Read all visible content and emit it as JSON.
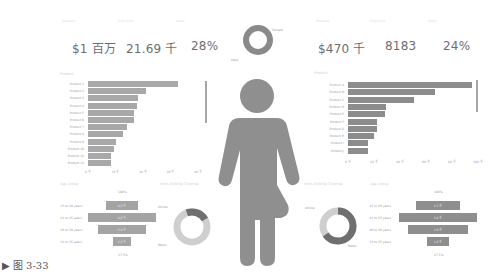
{
  "caption": "▶ 图 3-33",
  "left_panel": {
    "kpis": [
      {
        "label": "Revenue",
        "value": "$1 百万"
      },
      {
        "label": "Units Sold",
        "value": "21.69 千"
      },
      {
        "label": "Share",
        "value": "28%"
      }
    ],
    "bar_chart_title": "Product",
    "bar_chart": {
      "categories": [
        "Product 1",
        "Product 2",
        "Product 3",
        "Product 4",
        "Product 5",
        "Product 6",
        "Product 7",
        "Product 8",
        "Product 9",
        "Product 10",
        "Product 11",
        "Product 12"
      ],
      "values": [
        90,
        58,
        50,
        49,
        46,
        46,
        39,
        35,
        28,
        26,
        23,
        23
      ],
      "ticks": [
        "0 千",
        "10 千",
        "20 千",
        "30 千",
        "40 千"
      ]
    },
    "funnel_title": "Age Group",
    "funnel": {
      "top_label": "100%",
      "bottom_label": "17.5%",
      "rows": [
        {
          "label": "15 to 20 years",
          "value": "4.6 千"
        },
        {
          "label": "21 to 25 years",
          "value": "8.6 千"
        },
        {
          "label": "26 to 30 years",
          "value": "5.9 千"
        },
        {
          "label": "31 to 35 years",
          "value": "2.0 千"
        }
      ]
    },
    "donut_title": "Units Sold by Channel",
    "donut": {
      "labels": [
        "Online",
        "Retail"
      ],
      "values": [
        22,
        78
      ]
    }
  },
  "center": {
    "gender_donut": {
      "labels": [
        "Female",
        "Male"
      ],
      "values": [
        50,
        50
      ]
    },
    "figure": "gender-figure"
  },
  "right_panel": {
    "kpis": [
      {
        "label": "Revenue",
        "value": "$470 千"
      },
      {
        "label": "Units Sold",
        "value": "8183"
      },
      {
        "label": "Share",
        "value": "24%"
      }
    ],
    "bar_chart_title": "Product",
    "bar_chart": {
      "categories": [
        "Product A",
        "Product B",
        "Product C",
        "Product D",
        "Product E",
        "Product F",
        "Product G",
        "Product H",
        "Product I",
        "Product J"
      ],
      "values": [
        100,
        70,
        53,
        31,
        30,
        23,
        23,
        21,
        16,
        16
      ],
      "ticks": [
        "0 千",
        "20 千",
        "40 千",
        "60 千",
        "80 千",
        "100 千"
      ]
    },
    "donut_title": "Units Sold by Channel",
    "donut": {
      "labels": [
        "Online",
        "Retail"
      ],
      "values": [
        35,
        65
      ]
    },
    "funnel_title": "Age Group",
    "funnel": {
      "top_label": "100%",
      "bottom_label": "27.5%",
      "rows": [
        {
          "label": "15 to 20 years",
          "value": "2.1 千"
        },
        {
          "label": "21 to 25 years",
          "value": "3.8 千"
        },
        {
          "label": "26 to 30 years",
          "value": "2.9 千"
        },
        {
          "label": "31 to 35 years",
          "value": "1.0 千"
        }
      ]
    }
  },
  "chart_data": [
    {
      "type": "bar",
      "title": "Product (left)",
      "categories": [
        "Product 1",
        "Product 2",
        "Product 3",
        "Product 4",
        "Product 5",
        "Product 6",
        "Product 7",
        "Product 8",
        "Product 9",
        "Product 10",
        "Product 11",
        "Product 12"
      ],
      "values": [
        90,
        58,
        50,
        49,
        46,
        46,
        39,
        35,
        28,
        26,
        23,
        23
      ],
      "orientation": "horizontal"
    },
    {
      "type": "bar",
      "title": "Product (right)",
      "categories": [
        "Product A",
        "Product B",
        "Product C",
        "Product D",
        "Product E",
        "Product F",
        "Product G",
        "Product H",
        "Product I",
        "Product J"
      ],
      "values": [
        100,
        70,
        53,
        31,
        30,
        23,
        23,
        21,
        16,
        16
      ],
      "orientation": "horizontal"
    },
    {
      "type": "pie",
      "title": "Gender",
      "labels": [
        "Female",
        "Male"
      ],
      "values": [
        50,
        50
      ]
    },
    {
      "type": "pie",
      "title": "Channel (left)",
      "labels": [
        "Online",
        "Retail"
      ],
      "values": [
        22,
        78
      ]
    },
    {
      "type": "pie",
      "title": "Channel (right)",
      "labels": [
        "Online",
        "Retail"
      ],
      "values": [
        35,
        65
      ]
    },
    {
      "type": "bar",
      "title": "Age Group funnel (left)",
      "categories": [
        "15 to 20 years",
        "21 to 25 years",
        "26 to 30 years",
        "31 to 35 years"
      ],
      "values": [
        4.6,
        8.6,
        5.9,
        2.0
      ]
    },
    {
      "type": "bar",
      "title": "Age Group funnel (right)",
      "categories": [
        "15 to 20 years",
        "21 to 25 years",
        "26 to 30 years",
        "31 to 35 years"
      ],
      "values": [
        2.1,
        3.8,
        2.9,
        1.0
      ]
    }
  ]
}
